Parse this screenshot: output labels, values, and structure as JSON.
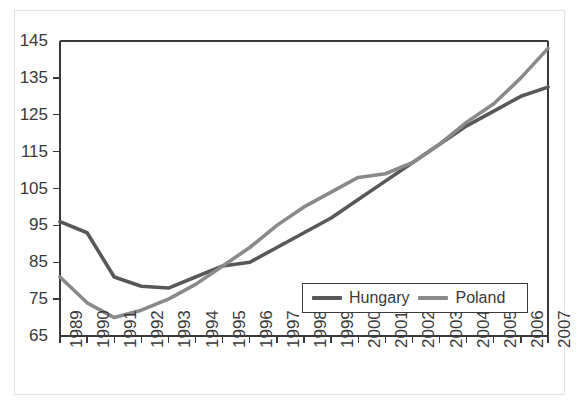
{
  "chart_data": {
    "type": "line",
    "title": "",
    "subtitle": "",
    "xlabel": "",
    "ylabel": "",
    "categories": [
      "1989",
      "1990",
      "1991",
      "1992",
      "1993",
      "1994",
      "1995",
      "1996",
      "1997",
      "1998",
      "1999",
      "2000",
      "2001",
      "2002",
      "2003",
      "2004",
      "2005",
      "2006",
      "2007"
    ],
    "yticks": [
      65,
      75,
      85,
      95,
      105,
      115,
      125,
      135,
      145
    ],
    "ylim": [
      65,
      145
    ],
    "grid": false,
    "legend_position": "inside-bottom-right",
    "series": [
      {
        "name": "Hungary",
        "color": "#58585a",
        "values": [
          96,
          93,
          81,
          78.5,
          78,
          81,
          84,
          85,
          89,
          93,
          97,
          102,
          107,
          112,
          117,
          122,
          126,
          130,
          132.5
        ]
      },
      {
        "name": "Poland",
        "color": "#8a8a8c",
        "values": [
          81,
          74,
          70,
          72,
          75,
          79,
          84,
          89,
          95,
          100,
          104,
          108,
          109,
          112,
          117,
          123,
          128,
          135,
          143
        ]
      }
    ],
    "annotations": []
  },
  "legend": {
    "entries": [
      {
        "label": "Hungary",
        "swatch_color": "#58585a"
      },
      {
        "label": "Poland",
        "swatch_color": "#8a8a8c"
      }
    ]
  },
  "colors": {
    "axis": "#3a3a3a",
    "outer_border": "#e2e2e2",
    "background": "#ffffff",
    "tick_text": "#3a3a3a"
  }
}
